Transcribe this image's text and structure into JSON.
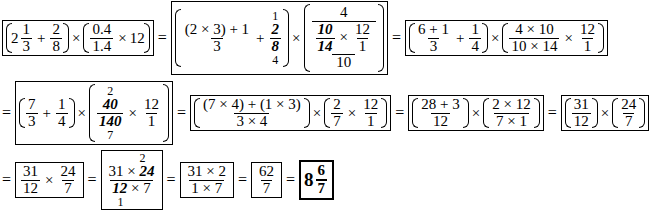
{
  "rows": [
    {
      "steps": [
        {
          "id": "r1s1",
          "text": "(2 1/3 + 2/8) × (0.4/1.4 × 12)"
        },
        {
          "id": "r1s2",
          "text": "((2×3)+1)/3 + 1(2)/8(4) × (4 / (10/14) × 12/1 / 10)"
        },
        {
          "id": "r1s3",
          "text": "((6+1)/3 + 1/4) × ((4×10)/(10×14) × 12/1)"
        }
      ]
    },
    {
      "steps": [
        {
          "id": "r2s1",
          "text": "= (7/3 + 1/4) × (40(2)/140(7) × 12/1)"
        },
        {
          "id": "r2s2",
          "text": "((7×4)+(1×3))/(3×4) × (2/7 × 12/1)"
        },
        {
          "id": "r2s3",
          "text": "(28+3)/12 × (2×12)/(7×1)"
        },
        {
          "id": "r2s4",
          "text": "(31/12) × (24/7)"
        }
      ]
    },
    {
      "steps": [
        {
          "id": "r3s1",
          "text": "= 31/12 × 24/7"
        },
        {
          "id": "r3s2",
          "text": "(31 × 24(2)) / (12(1) × 7)"
        },
        {
          "id": "r3s3",
          "text": "(31×2)/(1×7)"
        },
        {
          "id": "r3s4",
          "text": "62/7"
        },
        {
          "id": "r3s5",
          "text": "8 6/7"
        }
      ]
    }
  ],
  "t": {
    "eq": "=",
    "times": "×",
    "plus": "+",
    "n2": "2",
    "n1": "1",
    "n3": "3",
    "n8": "8",
    "n4": "4",
    "n04": "0.4",
    "n14d": "1.4",
    "n12": "12",
    "n2x3p1": "(2 × 3) + 1",
    "n10": "10",
    "n14": "14",
    "n6p1": "6 + 1",
    "n4x10": "4 × 10",
    "n10x14": "10 × 14",
    "n7": "7",
    "n40": "40",
    "n140": "140",
    "n7x4p1x3": "(7 × 4) + (1 × 3)",
    "n3x4": "3 × 4",
    "n28p3": "28 + 3",
    "n2x12": "2 × 12",
    "n7x1": "7 × 1",
    "n31": "31",
    "n24": "24",
    "n31x24": "31 × ",
    "n12x7": " × 7",
    "n31x2": "31 × 2",
    "n1x7": "1 × 7",
    "n62": "62",
    "w8": "8",
    "n6": "6"
  }
}
